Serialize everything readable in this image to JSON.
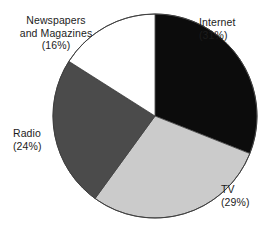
{
  "chart_data": {
    "type": "pie",
    "title": "",
    "subtitle": "",
    "xlabel": "",
    "ylabel": "",
    "legend_position": "none",
    "grid": false,
    "labels_on_slices": false,
    "label_placement": "outside",
    "start_angle_deg": 0,
    "direction": "clockwise",
    "categories": [
      "Internet",
      "TV",
      "Radio",
      "Newspapers and Magazines"
    ],
    "values": [
      31,
      29,
      24,
      16
    ],
    "units": "percent",
    "slices": [
      {
        "name": "Internet",
        "label_line1": "Internet",
        "label_line2": "(31%)",
        "value": 31,
        "color": "#0c0c0c",
        "start_deg": 0,
        "end_deg": 111.6
      },
      {
        "name": "TV",
        "label_line1": "TV",
        "label_line2": "(29%)",
        "value": 29,
        "color": "#cbcbcb",
        "start_deg": 111.6,
        "end_deg": 216.0
      },
      {
        "name": "Radio",
        "label_line1": "Radio",
        "label_line2": "(24%)",
        "value": 24,
        "color": "#4b4b4b",
        "start_deg": 216.0,
        "end_deg": 302.4
      },
      {
        "name": "Newspapers and Magazines",
        "label_line1": "Newspapers",
        "label_line2": "and Magazines",
        "label_line3": "(16%)",
        "value": 16,
        "color": "#ffffff",
        "start_deg": 302.4,
        "end_deg": 360.0
      }
    ],
    "outline_color": "#4a4a4a",
    "background_color": "#ffffff"
  }
}
